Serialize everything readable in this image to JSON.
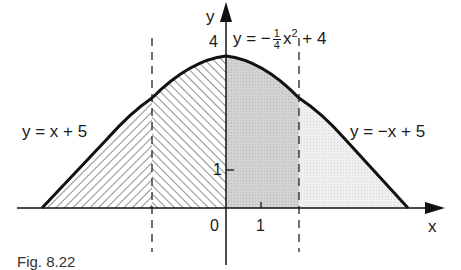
{
  "figure": {
    "caption": "Fig. 8.22",
    "axes": {
      "x_label": "x",
      "y_label": "y",
      "origin_label": "0",
      "x_tick_1": "1",
      "y_tick_1": "1",
      "y_tick_4": "4"
    },
    "curves": {
      "parabola": {
        "label_prefix": "y = −",
        "frac_num": "1",
        "frac_den": "4",
        "label_mid": "x",
        "label_sup": "2",
        "label_suffix": " + 4",
        "equation": "y = -1/4 x^2 + 4"
      },
      "left_line": {
        "label": "y = x + 5",
        "equation": "y = x + 5"
      },
      "right_line": {
        "label": "y = −x + 5",
        "equation": "y = -x + 5"
      }
    },
    "regions": [
      {
        "name": "left-outer",
        "x_range": [
          -5,
          -2
        ],
        "fill": "back-hatch"
      },
      {
        "name": "left-inner",
        "x_range": [
          -2,
          0
        ],
        "fill": "forward-hatch"
      },
      {
        "name": "right-inner",
        "x_range": [
          0,
          2
        ],
        "fill": "dark-dots",
        "color": "#cfcfcf"
      },
      {
        "name": "right-outer",
        "x_range": [
          2,
          5
        ],
        "fill": "light-dots",
        "color": "#ebebeb"
      }
    ],
    "dashed_lines": [
      {
        "x": -2
      },
      {
        "x": 2
      }
    ],
    "colors": {
      "stroke": "#111111",
      "dark_fill": "#cccccc",
      "light_fill": "#ececec"
    }
  }
}
